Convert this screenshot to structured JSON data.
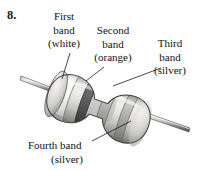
{
  "figure": {
    "number": "8.",
    "orientation_degrees": -20
  },
  "callouts": [
    {
      "id": "first-band",
      "lines": [
        "First",
        "band",
        "(white)"
      ],
      "band_color_name": "white",
      "band_color_hex": "#f2f2f0"
    },
    {
      "id": "second-band",
      "lines": [
        "Second",
        "band",
        "(orange)"
      ],
      "band_color_name": "orange",
      "band_color_hex": "#5a5a5a"
    },
    {
      "id": "third-band",
      "lines": [
        "Third",
        "band",
        "(silver)"
      ],
      "band_color_name": "silver",
      "band_color_hex": "#9e9e9c"
    },
    {
      "id": "fourth-band",
      "lines": [
        "Fourth band",
        "(silver)"
      ],
      "band_color_name": "silver",
      "band_color_hex": "#a8a8a6"
    }
  ],
  "colors": {
    "body_light": "#e8e7e4",
    "body_mid": "#c9c8c4",
    "body_shadow": "#9a9996",
    "band_white": "#f4f4f2",
    "band_orange": "#606060",
    "band_silver": "#a9a9a6",
    "lead_light": "#d8d8d6",
    "lead_dark": "#6f6f6e",
    "outline": "#3b3b3b",
    "text": "#111111",
    "background": "#ffffff"
  }
}
